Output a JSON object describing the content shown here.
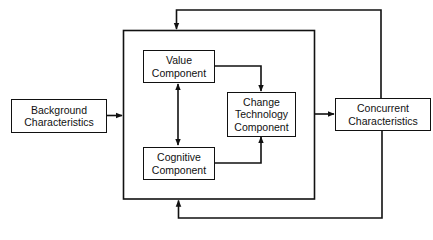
{
  "diagram": {
    "type": "flow",
    "nodes": {
      "background": {
        "lines": [
          "Background",
          "Characteristics"
        ]
      },
      "value": {
        "lines": [
          "Value",
          "Component"
        ]
      },
      "cognitive": {
        "lines": [
          "Cognitive",
          "Component"
        ]
      },
      "change": {
        "lines": [
          "Change",
          "Technology",
          "Component"
        ]
      },
      "concurrent": {
        "lines": [
          "Concurrent",
          "Characteristics"
        ]
      }
    },
    "edges": [
      {
        "from": "background",
        "to": "outer-system",
        "arrow": "end"
      },
      {
        "from": "value",
        "to": "cognitive",
        "arrow": "both"
      },
      {
        "from": "value",
        "to": "change",
        "arrow": "end"
      },
      {
        "from": "cognitive",
        "to": "change",
        "arrow": "end"
      },
      {
        "from": "outer-system",
        "to": "concurrent",
        "arrow": "end"
      },
      {
        "from": "concurrent",
        "to": "outer-system",
        "via": "top",
        "arrow": "end"
      },
      {
        "from": "concurrent",
        "to": "outer-system",
        "via": "bottom",
        "arrow": "end"
      }
    ],
    "colors": {
      "stroke": "#111111",
      "background": "#ffffff"
    }
  }
}
